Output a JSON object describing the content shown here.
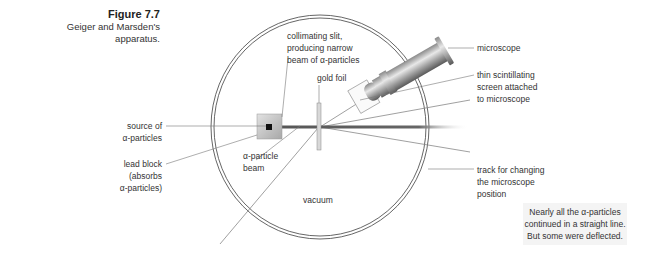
{
  "caption": {
    "figure_number": "Figure 7.7",
    "description_line1": "Geiger and Marsden's",
    "description_line2": "apparatus."
  },
  "labels": {
    "collimating_slit": [
      "collimating slit,",
      "producing narrow",
      "beam of α-particles"
    ],
    "gold_foil": "gold foil",
    "microscope": "microscope",
    "scintillating_screen": [
      "thin scintillating",
      "screen attached",
      "to microscope"
    ],
    "source": [
      "source of",
      "α-particles"
    ],
    "lead_block": [
      "lead block",
      "(absorbs",
      "α-particles)"
    ],
    "alpha_beam": [
      "α-particle",
      "beam"
    ],
    "vacuum": "vacuum",
    "track": [
      "track for changing",
      "the microscope",
      "position"
    ]
  },
  "note": {
    "lines": [
      "Nearly all the α-particles",
      "continued in a straight line.",
      "But some were deflected."
    ],
    "background": "#f4f4f4"
  }
}
